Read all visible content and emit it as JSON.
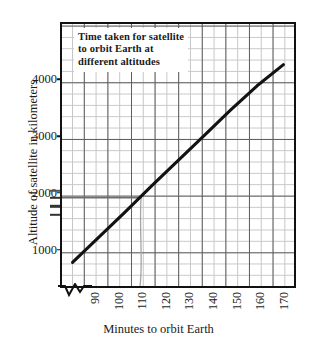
{
  "chart_data": {
    "type": "line",
    "title": "Time taken for satellite to orbit Earth at different altitudes",
    "title_lines": [
      "Time taken for satellite",
      "to orbit Earth at",
      "different altitudes"
    ],
    "xlabel": "Minutes to orbit Earth",
    "ylabel": "Altitude of satellite in kilometers",
    "xlim": [
      86,
      174
    ],
    "ylim": [
      0,
      4450
    ],
    "xticks": [
      90,
      100,
      110,
      120,
      130,
      140,
      150,
      160,
      170
    ],
    "xtick_labels": [
      "90",
      "100",
      "110",
      "120",
      "130",
      "140",
      "150",
      "160",
      "170"
    ],
    "yticks": [
      1000,
      2000,
      3000,
      4000
    ],
    "ytick_labels": [
      "1000",
      "2000",
      "3000",
      "4000"
    ],
    "grid": true,
    "grid_minor_x_step": 5,
    "grid_minor_y_step": 200,
    "legend": "none",
    "axis_break_x": true,
    "series": [
      {
        "name": "Satellite altitude vs orbital period",
        "color": "#121212",
        "x": [
          90,
          100,
          110,
          120,
          130,
          140,
          150,
          160,
          170
        ],
        "values": [
          400,
          830,
          1260,
          1700,
          2130,
          2560,
          2990,
          3400,
          3760
        ]
      }
    ],
    "annotations": [
      {
        "name": "read-off-horizontal-line",
        "type": "hline",
        "y": 1500,
        "x_from": 86,
        "x_to": 116,
        "color": "#6f6f6f"
      },
      {
        "name": "read-off-vertical-line",
        "type": "vline",
        "x": 116,
        "y_from": 0,
        "y_to": 1500,
        "color": "#9a9a9a"
      },
      {
        "name": "axis-mark-upper",
        "type": "ytick-mark",
        "y": 1620,
        "color": "#555"
      },
      {
        "name": "axis-mark-middle",
        "type": "ytick-mark",
        "y": 1500,
        "color": "#333"
      },
      {
        "name": "axis-mark-lower",
        "type": "ytick-mark",
        "y": 1355,
        "color": "#333"
      },
      {
        "name": "axis-mark-bottom",
        "type": "ytick-mark",
        "y": 1205,
        "color": "#333"
      }
    ]
  }
}
